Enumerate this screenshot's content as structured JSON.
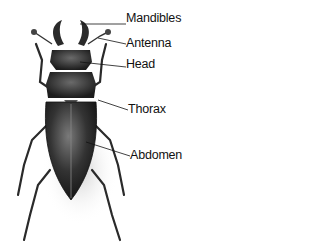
{
  "diagram": {
    "labels": [
      {
        "id": "mandibles",
        "text": "Mandibles",
        "x": 126,
        "y": 11
      },
      {
        "id": "antenna",
        "text": "Antenna",
        "x": 126,
        "y": 36
      },
      {
        "id": "head",
        "text": "Head",
        "x": 126,
        "y": 57
      },
      {
        "id": "thorax",
        "text": "Thorax",
        "x": 128,
        "y": 102
      },
      {
        "id": "abdomen",
        "text": "Abdomen",
        "x": 130,
        "y": 148
      }
    ],
    "colors": {
      "body": "#2a2a2a",
      "shell_highlight": "#6a6a6a",
      "line": "#111111",
      "background": "#ffffff"
    }
  }
}
